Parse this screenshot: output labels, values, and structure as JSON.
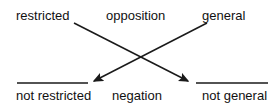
{
  "diagram": {
    "type": "semantic-opposition-square",
    "background_color": "#ffffff",
    "stroke_color": "#1a1a1a",
    "text_color": "#111111",
    "labels": {
      "top_left": "restricted",
      "top_center": "opposition",
      "top_right": "general",
      "bottom_left": "not restricted",
      "bottom_center": "negation",
      "bottom_right": "not general"
    },
    "edges": [
      {
        "name": "restricted-to-not-general",
        "from": "restricted",
        "to": "not general",
        "style": "arrow",
        "x1": 74,
        "y1": 23,
        "x2": 190,
        "y2": 82
      },
      {
        "name": "general-to-not-restricted",
        "from": "general",
        "to": "not restricted",
        "style": "arrow",
        "x1": 207,
        "y1": 23,
        "x2": 92,
        "y2": 82
      }
    ],
    "rules": [
      {
        "name": "underline-not-restricted",
        "x1": 17,
        "y1": 83,
        "x2": 88,
        "y2": 83
      },
      {
        "name": "underline-not-general",
        "x1": 196,
        "y1": 83,
        "x2": 268,
        "y2": 83
      }
    ]
  }
}
